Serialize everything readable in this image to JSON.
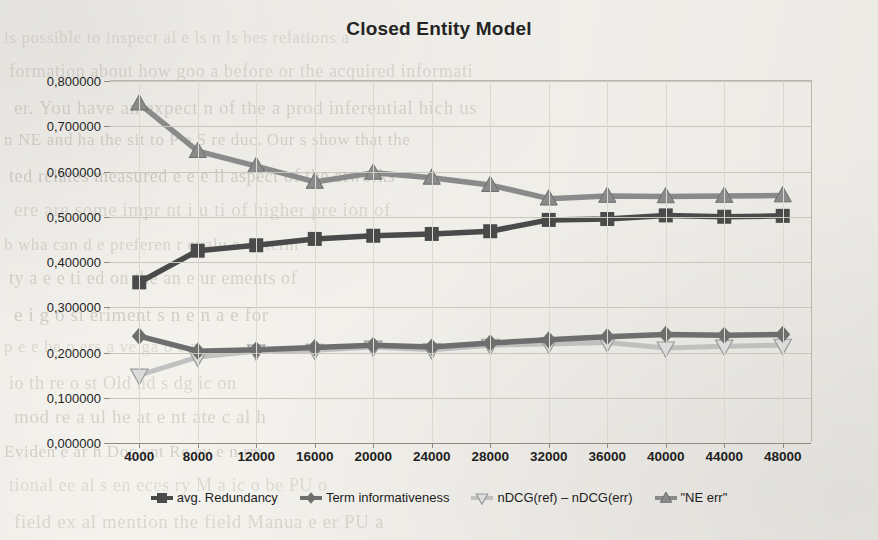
{
  "chart_data": {
    "type": "line",
    "title": "Closed Entity Model",
    "xlabel": "",
    "ylabel": "",
    "x": [
      4000,
      8000,
      12000,
      16000,
      20000,
      24000,
      28000,
      32000,
      36000,
      40000,
      44000,
      48000
    ],
    "categories": [
      "4000",
      "8000",
      "12000",
      "16000",
      "20000",
      "24000",
      "28000",
      "32000",
      "36000",
      "40000",
      "44000",
      "48000"
    ],
    "ylim": [
      0.0,
      0.8
    ],
    "ytick_labels": [
      "0,000000",
      "0,100000",
      "0,200000",
      "0,300000",
      "0,400000",
      "0,500000",
      "0,600000",
      "0,700000",
      "0,800000"
    ],
    "ytick_values": [
      0.0,
      0.1,
      0.2,
      0.3,
      0.4,
      0.5,
      0.6,
      0.7,
      0.8
    ],
    "grid": true,
    "legend_position": "bottom",
    "series": [
      {
        "name": "avg. Redundancy",
        "marker": "square",
        "color": "#4a4a4a",
        "values": [
          0.355,
          0.425,
          0.437,
          0.451,
          0.458,
          0.462,
          0.468,
          0.493,
          0.495,
          0.503,
          0.5,
          0.502
        ]
      },
      {
        "name": "Term informativeness",
        "marker": "diamond",
        "color": "#6e6e6e",
        "values": [
          0.236,
          0.203,
          0.206,
          0.211,
          0.216,
          0.212,
          0.221,
          0.228,
          0.235,
          0.24,
          0.238,
          0.24
        ]
      },
      {
        "name": "nDCG(ref) – nDCG(err)",
        "marker": "triangle-down",
        "color": "#b8b8b8",
        "values": [
          0.15,
          0.19,
          0.203,
          0.205,
          0.212,
          0.206,
          0.216,
          0.219,
          0.222,
          0.21,
          0.214,
          0.216
        ]
      },
      {
        "name": "\"NE err\"",
        "marker": "triangle-up",
        "color": "#8a8a8a",
        "values": [
          0.75,
          0.645,
          0.612,
          0.577,
          0.597,
          0.586,
          0.57,
          0.54,
          0.546,
          0.545,
          0.546,
          0.547
        ]
      }
    ]
  },
  "legend": {
    "items": [
      {
        "label": "avg. Redundancy"
      },
      {
        "label": "Term informativeness"
      },
      {
        "label": "nDCG(ref) – nDCG(err)"
      },
      {
        "label": "\"NE err\""
      }
    ]
  },
  "background_text": {
    "lines": [
      "is possible to inspect al   e   ls   n   ls  bes   relations a",
      "formation about how goo   a  before or the acquired   informati",
      "er. You have an expect  n  of  the   a  prod  inferential   hich us",
      "n NE and ha  the sit  to  P   e  S  re  duc. Our  s  show that the",
      "ted  relates  measured   e  e  e  ll  aspect of the   etworks",
      "ere  are  some  impr  nt  i  u   ti  of  higher   pre  ion of",
      "b  wha  can  d  e  preferen  r  evalu  e  of  term",
      "ty  a   e   e  ti   ed  on  the   an  e  ur  ements of",
      "e  i  g  o   si     eriment  s  n   e  n  a  e  for",
      "p  e   e     he  o     ers  a  ve   ga  o  e  n",
      "io  th  re   o  st   Old  nd  s     dg   ic   on",
      "mod  re   a  ul   he  at  e   nt  ate  c  al     h",
      "Eviden  e  ar  h   Doc  ent  Re   ev   e  n  rm",
      "tional  ee   al   s  en  eces   ry   M   a  ic  o   be  PU  o",
      "field  ex   al  mention  the  field  Manua     e    er  PU  a"
    ]
  }
}
